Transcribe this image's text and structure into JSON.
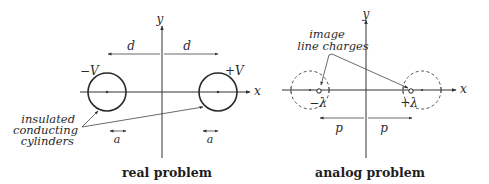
{
  "real_problem": {
    "caption": "real problem",
    "axis_x": "x",
    "axis_y": "y",
    "left_potential": "−V",
    "right_potential": "+V",
    "distance_left": "d",
    "distance_right": "d",
    "radius_left": "a",
    "radius_right": "a",
    "annotation_line1": "insulated",
    "annotation_line2": "conducting",
    "annotation_line3": "cylinders"
  },
  "analog_problem": {
    "caption": "analog problem",
    "axis_x": "x",
    "axis_y": "y",
    "left_charge": "−λ",
    "right_charge": "+λ",
    "distance_left": "p",
    "distance_right": "p",
    "annotation_line1": "image",
    "annotation_line2": "line charges"
  }
}
